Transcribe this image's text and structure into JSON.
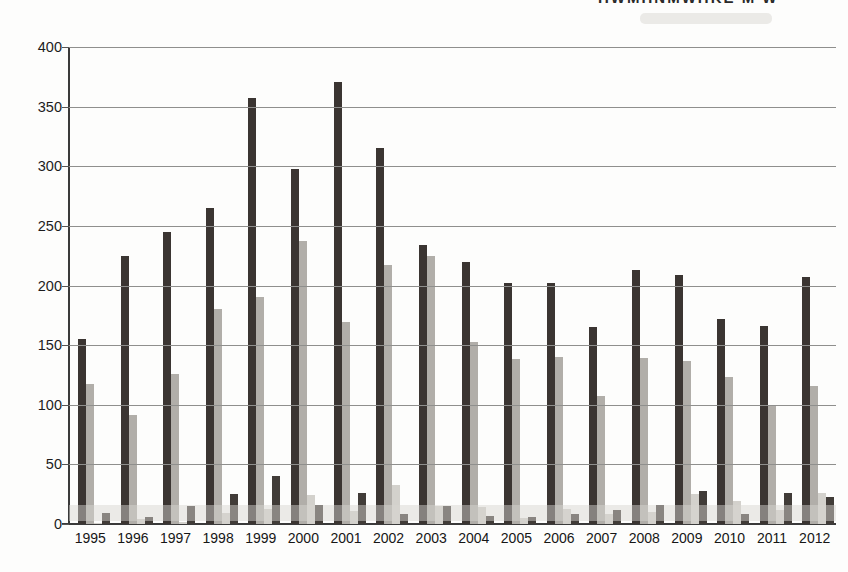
{
  "chart_data": {
    "type": "bar",
    "title": "",
    "xlabel": "",
    "ylabel": "",
    "categories": [
      "1995",
      "1996",
      "1997",
      "1998",
      "1999",
      "2000",
      "2001",
      "2002",
      "2003",
      "2004",
      "2005",
      "2006",
      "2007",
      "2008",
      "2009",
      "2010",
      "2011",
      "2012"
    ],
    "series": [
      {
        "name": "series-1-dark-tall",
        "color": "#3b3532",
        "values": [
          155,
          225,
          245,
          265,
          357,
          298,
          371,
          315,
          234,
          220,
          202,
          202,
          165,
          213,
          209,
          172,
          166,
          207
        ]
      },
      {
        "name": "series-2-gray",
        "color": "#b1aea9",
        "values": [
          117,
          91,
          126,
          180,
          190,
          237,
          169,
          217,
          225,
          153,
          138,
          140,
          107,
          139,
          137,
          123,
          99,
          116
        ]
      },
      {
        "name": "series-3-light-gray",
        "color": "#d3d1cc",
        "values": [
          1,
          4,
          2,
          9,
          13,
          24,
          11,
          33,
          15,
          14,
          5,
          13,
          8,
          10,
          25,
          19,
          12,
          26
        ]
      },
      {
        "name": "series-4-dark-small",
        "color": "#413c38",
        "values": [
          9,
          6,
          15,
          25,
          40,
          16,
          26,
          8,
          15,
          7,
          6,
          8,
          12,
          16,
          28,
          8,
          26,
          23
        ]
      }
    ],
    "ylim": [
      0,
      400
    ],
    "yticks": [
      0,
      50,
      100,
      150,
      200,
      250,
      300,
      350,
      400
    ],
    "grid": true,
    "legend_position": "top-right, cut off by image edge"
  },
  "artifacts": {
    "clipped_top_text": "HWMHNMWHKE M W",
    "note_label": "illegible text line cut off at top edge"
  },
  "colors": {
    "background": "#fdfdfc",
    "gridline": "#8f8f8d",
    "axis": "#3a3a3a",
    "tick_text": "#1c1c1c",
    "scan_band": "rgba(216,214,209,0.48)"
  }
}
